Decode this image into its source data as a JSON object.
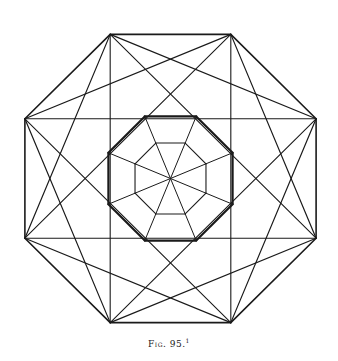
{
  "figure": {
    "caption": "Fig. 95.",
    "footnote_mark": "1",
    "stroke_color": "#1a1a1a",
    "background": "#ffffff",
    "polygon_sides": 8
  }
}
